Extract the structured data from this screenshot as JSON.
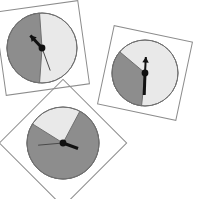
{
  "scene": {
    "title": "Three analog clock faces with shaded sectors",
    "width": 197,
    "height": 199,
    "background_color": "#ffffff",
    "colors": {
      "dark_sector": "#8d8d8d",
      "light_sector": "#e9e9e9",
      "dial_outline": "#6f6f6f",
      "frame_outline": "#8c8c8c",
      "hand": "#111111",
      "thin_hand": "#4a4a4a",
      "hub": "#111111"
    }
  },
  "clocks": [
    {
      "id": "clock-top-left",
      "label": "Clock 1",
      "center_x": 42,
      "center_y": 48,
      "radius": 35,
      "frame_rotation_deg": -8,
      "frame_half_size": 42,
      "dark_sector_start_deg": 184,
      "dark_sector_end_deg": 356,
      "dark_sector_color": "#8d8d8d",
      "light_sector_color": "#e9e9e9",
      "hands": [
        {
          "name": "hour-hand",
          "angle_deg": 317,
          "length": 17,
          "width": 3,
          "style": "arrow",
          "color": "#111111"
        },
        {
          "name": "minute-hand",
          "angle_deg": 160,
          "length": 24,
          "width": 1,
          "style": "plain",
          "color": "#4a4a4a"
        }
      ]
    },
    {
      "id": "clock-right",
      "label": "Clock 2",
      "center_x": 145,
      "center_y": 73,
      "radius": 33,
      "frame_rotation_deg": 12,
      "frame_half_size": 40,
      "dark_sector_start_deg": 186,
      "dark_sector_end_deg": 310,
      "dark_sector_color": "#8d8d8d",
      "light_sector_color": "#e9e9e9",
      "hands": [
        {
          "name": "minute-hand",
          "angle_deg": 182,
          "length": 22,
          "width": 3,
          "style": "plain",
          "color": "#111111"
        },
        {
          "name": "hour-hand",
          "angle_deg": 3,
          "length": 16,
          "width": 2,
          "style": "arrow",
          "color": "#111111"
        }
      ]
    },
    {
      "id": "clock-bottom-left",
      "label": "Clock 3",
      "center_x": 63,
      "center_y": 143,
      "radius": 36,
      "frame_rotation_deg": 45,
      "frame_half_size": 45,
      "dark_sector_start_deg": 28,
      "dark_sector_end_deg": 302,
      "dark_sector_color": "#8d8d8d",
      "light_sector_color": "#e9e9e9",
      "hands": [
        {
          "name": "minute-hand",
          "angle_deg": 265,
          "length": 25,
          "width": 1,
          "style": "plain",
          "color": "#4a4a4a"
        },
        {
          "name": "hour-hand",
          "angle_deg": 110,
          "length": 16,
          "width": 3,
          "style": "plain",
          "color": "#111111"
        }
      ]
    }
  ]
}
